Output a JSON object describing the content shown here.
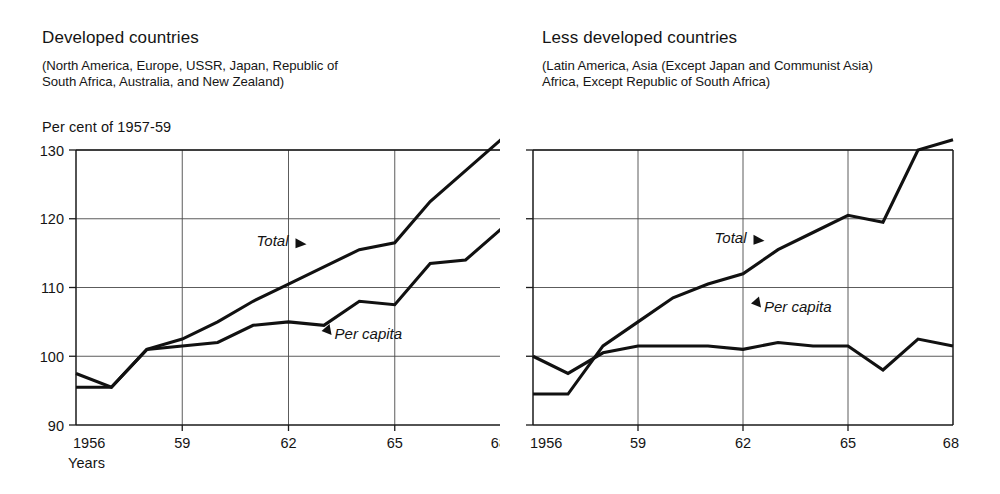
{
  "panels": [
    {
      "id": "developed",
      "title": "Developed countries",
      "subtitle": "(North America, Europe, USSR, Japan, Republic of\nSouth Africa, Australia, and New Zealand)",
      "y_axis_caption": "Per cent of 1957-59",
      "x_axis_caption": "Years",
      "show_y_labels": true,
      "total_label": "Total",
      "percapita_label": "Per capita"
    },
    {
      "id": "less-developed",
      "title": "Less developed countries",
      "subtitle": "(Latin America, Asia (Except Japan and Communist Asia)\nAfrica, Except Republic of South Africa)",
      "y_axis_caption": "",
      "x_axis_caption": "",
      "show_y_labels": false,
      "total_label": "Total",
      "percapita_label": "Per capita"
    }
  ],
  "chart_data": [
    {
      "type": "line",
      "title": "Developed countries",
      "subtitle": "(North America, Europe, USSR, Japan, Republic of South Africa, Australia, and New Zealand)",
      "xlabel": "Years",
      "ylabel": "Per cent of 1957-59",
      "xlim": [
        1956,
        1968
      ],
      "ylim": [
        90,
        133
      ],
      "yticks": [
        90,
        100,
        110,
        120,
        130
      ],
      "ytick_labels": [
        "90",
        "100",
        "110",
        "120",
        "130"
      ],
      "xticks": [
        1956,
        1959,
        1962,
        1965,
        1968
      ],
      "xtick_labels": [
        "1956",
        "59",
        "62",
        "65",
        "68"
      ],
      "grid": true,
      "legend": "inline-annotations",
      "x": [
        1956,
        1957,
        1958,
        1959,
        1960,
        1961,
        1962,
        1963,
        1964,
        1965,
        1966,
        1967,
        1968
      ],
      "series": [
        {
          "name": "Total",
          "values": [
            95.5,
            95.5,
            101.0,
            102.5,
            105.0,
            108.0,
            110.5,
            113.0,
            115.5,
            116.5,
            122.5,
            127.0,
            131.5
          ]
        },
        {
          "name": "Per capita",
          "values": [
            97.5,
            95.5,
            101.0,
            101.5,
            102.0,
            104.5,
            105.0,
            104.5,
            108.0,
            107.5,
            113.5,
            114.0,
            118.5
          ]
        }
      ],
      "annotations": [
        {
          "text": "Total",
          "x": 1962.0,
          "y": 116.0
        },
        {
          "text": "Per capita",
          "x": 1963.3,
          "y": 102.5
        }
      ]
    },
    {
      "type": "line",
      "title": "Less developed countries",
      "subtitle": "(Latin America, Asia (Except Japan and Communist Asia) Africa, Except Republic of South Africa)",
      "xlabel": "Years",
      "ylabel": "Per cent of 1957-59",
      "xlim": [
        1956,
        1968
      ],
      "ylim": [
        90,
        133
      ],
      "yticks": [
        90,
        100,
        110,
        120,
        130
      ],
      "ytick_labels": [
        "",
        "",
        "",
        "",
        ""
      ],
      "xticks": [
        1956,
        1959,
        1962,
        1965,
        1968
      ],
      "xtick_labels": [
        "1956",
        "59",
        "62",
        "65",
        "68"
      ],
      "grid": true,
      "legend": "inline-annotations",
      "x": [
        1956,
        1957,
        1958,
        1959,
        1960,
        1961,
        1962,
        1963,
        1964,
        1965,
        1966,
        1967,
        1968
      ],
      "series": [
        {
          "name": "Total",
          "values": [
            94.5,
            94.5,
            101.5,
            105.0,
            108.5,
            110.5,
            112.0,
            115.5,
            118.0,
            120.5,
            119.5,
            130.0,
            131.5
          ]
        },
        {
          "name": "Per capita",
          "values": [
            100.0,
            97.5,
            100.5,
            101.5,
            101.5,
            101.5,
            101.0,
            102.0,
            101.5,
            101.5,
            98.0,
            102.5,
            101.5
          ]
        }
      ],
      "annotations": [
        {
          "text": "Total",
          "x": 1962.1,
          "y": 116.5
        },
        {
          "text": "Per capita",
          "x": 1962.6,
          "y": 106.5
        }
      ]
    }
  ]
}
